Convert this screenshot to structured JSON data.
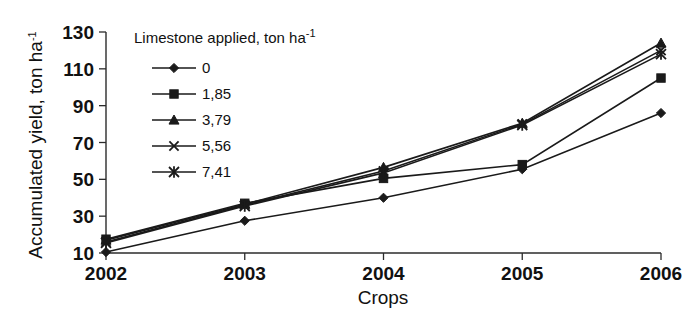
{
  "chart_data": {
    "type": "line",
    "title": "",
    "xlabel": "Crops",
    "ylabel": "Accumulated yield, ton ha-1",
    "ylabel_base": "Accumulated yield, ton ha",
    "ylabel_sup": "-1",
    "categories": [
      "2002",
      "2003",
      "2004",
      "2005",
      "2006"
    ],
    "x": [
      2002,
      2003,
      2004,
      2005,
      2006
    ],
    "ylim": [
      10,
      130
    ],
    "yticks": [
      10,
      30,
      50,
      70,
      90,
      110,
      130
    ],
    "grid": false,
    "legend_position": "upper-left-inside",
    "legend_title_base": "Limestone applied, ton ha",
    "legend_title_sup": "-1",
    "legend_title": "Limestone applied, ton ha-1",
    "series": [
      {
        "name": "0",
        "marker": "diamond",
        "values": [
          10.5,
          27.5,
          40.0,
          55.5,
          86.0
        ]
      },
      {
        "name": "1,85",
        "marker": "square",
        "values": [
          17.5,
          37.0,
          50.5,
          58.0,
          105.0
        ]
      },
      {
        "name": "3,79",
        "marker": "triangle",
        "values": [
          17.0,
          36.5,
          56.5,
          80.5,
          124.0
        ]
      },
      {
        "name": "5,56",
        "marker": "cross-x",
        "values": [
          16.0,
          36.0,
          54.5,
          80.0,
          120.0
        ]
      },
      {
        "name": "7,41",
        "marker": "star",
        "values": [
          15.5,
          35.5,
          53.5,
          79.5,
          118.0
        ]
      }
    ]
  },
  "colors": {
    "ink": "#1a1a1a",
    "axis": "#2b2b2b",
    "background": "#ffffff"
  }
}
